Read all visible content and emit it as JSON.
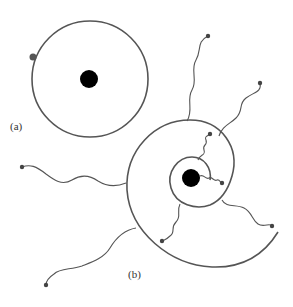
{
  "diagram": {
    "panel_a": {
      "label": "(a)",
      "orbit": {
        "cx": 90,
        "cy": 79,
        "r": 58
      },
      "nucleus": {
        "cx": 89,
        "cy": 79,
        "r": 9
      },
      "particle": {
        "cx": 33,
        "cy": 57,
        "r": 3.5
      }
    },
    "panel_b": {
      "label": "(b)",
      "nucleus": {
        "cx": 191,
        "cy": 178,
        "r": 9
      },
      "description": "spiral orbit with radiating wavy lines ending in dots",
      "wave_endpoints": [
        [
          208,
          36
        ],
        [
          260,
          83
        ],
        [
          22,
          167
        ],
        [
          46,
          285
        ],
        [
          210,
          134
        ],
        [
          222,
          183
        ],
        [
          162,
          241
        ],
        [
          272,
          226
        ]
      ]
    },
    "colors": {
      "line": "#555555",
      "nucleus": "#000000",
      "background": "#ffffff"
    }
  }
}
